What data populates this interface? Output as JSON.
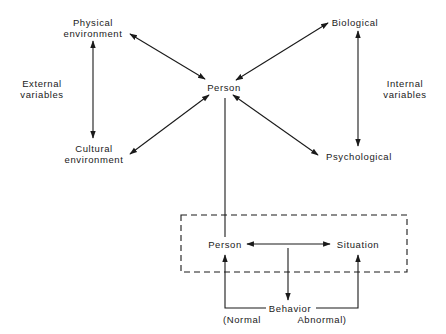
{
  "diagram": {
    "top": {
      "physical_environment": [
        "Physical",
        "environment"
      ],
      "cultural_environment": [
        "Cultural",
        "environment"
      ],
      "external_variables": [
        "External",
        "variables"
      ],
      "person": "Person",
      "biological": "Biological",
      "psychological": "Psychological",
      "internal_variables": [
        "Internal",
        "variables"
      ]
    },
    "bottom": {
      "person": "Person",
      "situation": "Situation",
      "behavior": "Behavior",
      "normal": "(Normal",
      "abnormal": "Abnormal)"
    },
    "colors": {
      "ink": "#1a1a1a",
      "background": "#ffffff"
    }
  }
}
